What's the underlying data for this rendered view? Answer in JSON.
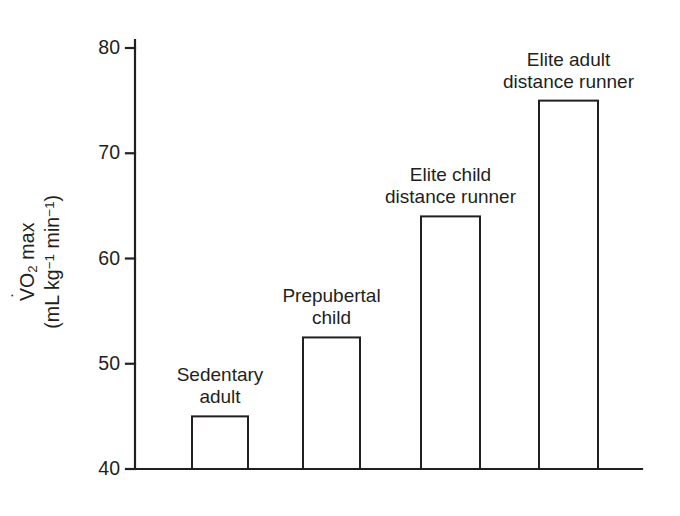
{
  "chart_data": {
    "type": "bar",
    "title": "",
    "subtitle": "",
    "xlabel": "",
    "ylabel": "VO2 max (mL kg^-1 min^-1)",
    "ylabel_parts": {
      "symbol": "V",
      "overdot": "˙",
      "subscript": "2",
      "qualifier": " max",
      "units_open": "(mL kg",
      "units_exp1": "−1",
      "units_mid": " min",
      "units_exp2": "−1",
      "units_close": ")"
    },
    "categories": [
      "Sedentary adult",
      "Prepubertal child",
      "Elite child distance runner",
      "Elite adult distance runner"
    ],
    "category_lines": [
      [
        "Sedentary",
        "adult"
      ],
      [
        "Prepubertal",
        "child"
      ],
      [
        "Elite child",
        "distance runner"
      ],
      [
        "Elite adult",
        "distance runner"
      ]
    ],
    "values": [
      45,
      52.5,
      64,
      75
    ],
    "ylim": [
      40,
      82
    ],
    "yticks": [
      40,
      50,
      60,
      70,
      80
    ],
    "ytick_labels": [
      "40",
      "50",
      "60",
      "70",
      "80"
    ],
    "grid": false,
    "legend": false,
    "legend_position": "none",
    "bar_style": "outline",
    "bar_fill": "#ffffff",
    "bar_stroke": "#231f20",
    "axis_color": "#231f20",
    "text_color": "#231f20",
    "background": "#ffffff"
  }
}
